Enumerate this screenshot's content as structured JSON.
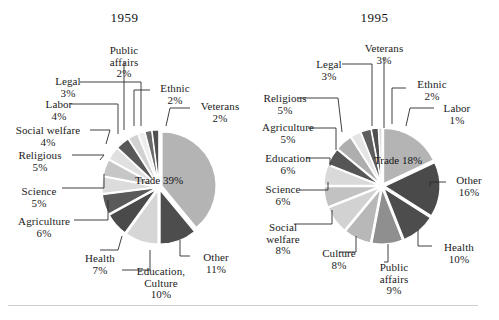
{
  "page": {
    "top_cut_text": "partially cropped line of text at top edge",
    "divider": "horizontal-rule"
  },
  "chart_data": [
    {
      "type": "pie",
      "title": "1959",
      "panel": "left",
      "categories": [
        "Trade",
        "Other",
        "Education, Culture",
        "Health",
        "Agriculture",
        "Science",
        "Religious",
        "Social welfare",
        "Labor",
        "Legal",
        "Public affairs",
        "Ethnic",
        "Veterans"
      ],
      "values": [
        39,
        11,
        10,
        7,
        6,
        5,
        5,
        4,
        4,
        3,
        2,
        2,
        2
      ],
      "labels": [
        {
          "name": "Trade",
          "pct": "39%",
          "inside": true
        },
        {
          "name": "Other",
          "pct": "11%",
          "inside": false
        },
        {
          "name": "Education,",
          "name2": "Culture",
          "pct": "10%",
          "inside": false
        },
        {
          "name": "Health",
          "pct": "7%",
          "inside": false
        },
        {
          "name": "Agriculture",
          "pct": "6%",
          "inside": false
        },
        {
          "name": "Science",
          "pct": "5%",
          "inside": false
        },
        {
          "name": "Religious",
          "pct": "5%",
          "inside": false
        },
        {
          "name": "Social welfare",
          "pct": "4%",
          "inside": false
        },
        {
          "name": "Labor",
          "pct": "4%",
          "inside": false
        },
        {
          "name": "Legal",
          "pct": "3%",
          "inside": false
        },
        {
          "name": "Public",
          "name2": "affairs",
          "pct": "2%",
          "inside": false
        },
        {
          "name": "Ethnic",
          "pct": "2%",
          "inside": false
        },
        {
          "name": "Veterans",
          "pct": "2%",
          "inside": false
        }
      ],
      "legend": "none",
      "grid": false
    },
    {
      "type": "pie",
      "title": "1995",
      "panel": "right",
      "categories": [
        "Trade",
        "Other",
        "Health",
        "Public affairs",
        "Culture",
        "Social welfare",
        "Science",
        "Education",
        "Agriculture",
        "Religious",
        "Legal",
        "Veterans",
        "Ethnic",
        "Labor"
      ],
      "values": [
        18,
        16,
        10,
        9,
        8,
        8,
        6,
        6,
        5,
        5,
        3,
        3,
        2,
        1
      ],
      "labels": [
        {
          "name": "Trade",
          "pct": "18%",
          "inside": true
        },
        {
          "name": "Other",
          "pct": "16%",
          "inside": false
        },
        {
          "name": "Health",
          "pct": "10%",
          "inside": false
        },
        {
          "name": "Public",
          "name2": "affairs",
          "pct": "9%",
          "inside": false
        },
        {
          "name": "Culture",
          "pct": "8%",
          "inside": false
        },
        {
          "name": "Social",
          "name2": "welfare",
          "pct": "8%",
          "inside": false
        },
        {
          "name": "Science",
          "pct": "6%",
          "inside": false
        },
        {
          "name": "Education",
          "pct": "6%",
          "inside": false
        },
        {
          "name": "Agriculture",
          "pct": "5%",
          "inside": false
        },
        {
          "name": "Religious",
          "pct": "5%",
          "inside": false
        },
        {
          "name": "Legal",
          "pct": "3%",
          "inside": false
        },
        {
          "name": "Veterans",
          "pct": "3%",
          "inside": false
        },
        {
          "name": "Ethnic",
          "pct": "2%",
          "inside": false
        },
        {
          "name": "Labor",
          "pct": "1%",
          "inside": false
        }
      ],
      "legend": "none",
      "grid": false
    }
  ],
  "colors": {
    "slice_light": "#b9b9b9",
    "slice_mid": "#9a9a9a",
    "slice_dark": "#4a4a4a",
    "slice_pale": "#dcdcdc",
    "leader_line": "#2a2a2a",
    "text": "#1a1a1a",
    "rule": "#cfcfcf",
    "background": "#ffffff"
  },
  "left_chart": {
    "title": "1959",
    "inside_label": {
      "name": "Trade",
      "pct": "39%"
    },
    "callouts": [
      {
        "key": "public_affairs",
        "l1": "Public",
        "l2": "affairs",
        "pct": "2%"
      },
      {
        "key": "legal",
        "l1": "Legal",
        "pct": "3%"
      },
      {
        "key": "ethnic",
        "l1": "Ethnic",
        "pct": "2%"
      },
      {
        "key": "veterans",
        "l1": "Veterans",
        "pct": "2%"
      },
      {
        "key": "labor",
        "l1": "Labor",
        "pct": "4%"
      },
      {
        "key": "social_welfare",
        "l1": "Social welfare",
        "pct": "4%"
      },
      {
        "key": "religious",
        "l1": "Religious",
        "pct": "5%"
      },
      {
        "key": "science",
        "l1": "Science",
        "pct": "5%"
      },
      {
        "key": "agriculture",
        "l1": "Agriculture",
        "pct": "6%"
      },
      {
        "key": "health",
        "l1": "Health",
        "pct": "7%"
      },
      {
        "key": "education_culture",
        "l1": "Education,",
        "l2": "Culture",
        "pct": "10%"
      },
      {
        "key": "other",
        "l1": "Other",
        "pct": "11%"
      }
    ]
  },
  "right_chart": {
    "title": "1995",
    "inside_label": {
      "name": "Trade",
      "pct": "18%"
    },
    "callouts": [
      {
        "key": "veterans",
        "l1": "Veterans",
        "pct": "3%"
      },
      {
        "key": "legal",
        "l1": "Legal",
        "pct": "3%"
      },
      {
        "key": "ethnic",
        "l1": "Ethnic",
        "pct": "2%"
      },
      {
        "key": "labor",
        "l1": "Labor",
        "pct": "1%"
      },
      {
        "key": "religious",
        "l1": "Religious",
        "pct": "5%"
      },
      {
        "key": "agriculture",
        "l1": "Agriculture",
        "pct": "5%"
      },
      {
        "key": "education",
        "l1": "Education",
        "pct": "6%"
      },
      {
        "key": "science",
        "l1": "Science",
        "pct": "6%"
      },
      {
        "key": "social_welfare",
        "l1": "Social",
        "l2": "welfare",
        "pct": "8%"
      },
      {
        "key": "culture",
        "l1": "Culture",
        "pct": "8%"
      },
      {
        "key": "public_affairs",
        "l1": "Public",
        "l2": "affairs",
        "pct": "9%"
      },
      {
        "key": "other",
        "l1": "Other",
        "pct": "16%"
      },
      {
        "key": "health",
        "l1": "Health",
        "pct": "10%"
      }
    ]
  }
}
